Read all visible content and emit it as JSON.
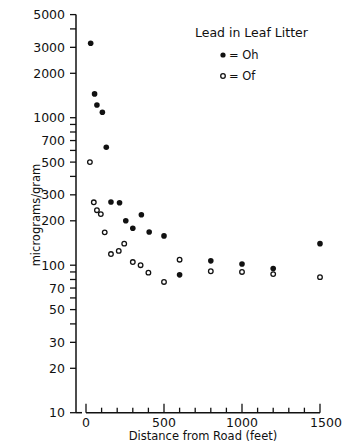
{
  "chart_data": {
    "type": "scatter",
    "title": "",
    "xlabel": "Distance from Road (feet)",
    "ylabel": "micrograms/gram",
    "xlim": [
      0,
      1500
    ],
    "ylim": [
      10,
      5000
    ],
    "yscale": "log",
    "grid": false,
    "legend_position": "upper right",
    "legend_title": "Lead in Leaf Litter",
    "x_ticks": [
      0,
      100,
      200,
      300,
      400,
      500,
      600,
      700,
      800,
      900,
      1000,
      1100,
      1200,
      1300,
      1400,
      1500
    ],
    "x_tick_labels": [
      {
        "value": 0,
        "label": "0"
      },
      {
        "value": 500,
        "label": "500"
      },
      {
        "value": 1000,
        "label": "1000"
      },
      {
        "value": 1500,
        "label": "1500"
      }
    ],
    "y_ticks": [
      10,
      20,
      30,
      40,
      50,
      60,
      70,
      80,
      90,
      100,
      200,
      300,
      400,
      500,
      600,
      700,
      800,
      900,
      1000,
      2000,
      3000,
      4000,
      5000
    ],
    "y_tick_labels": [
      "10",
      "20",
      "30",
      "50",
      "70",
      "100",
      "200",
      "300",
      "500",
      "700",
      "1000",
      "2000",
      "3000",
      "5000"
    ],
    "series": [
      {
        "name": "Oh",
        "legend_label": "= Oh",
        "marker": "filled-circle",
        "points": [
          {
            "x": 30,
            "y": 3200
          },
          {
            "x": 55,
            "y": 1450
          },
          {
            "x": 70,
            "y": 1220
          },
          {
            "x": 105,
            "y": 1090
          },
          {
            "x": 130,
            "y": 630
          },
          {
            "x": 160,
            "y": 268
          },
          {
            "x": 215,
            "y": 265
          },
          {
            "x": 255,
            "y": 200
          },
          {
            "x": 300,
            "y": 178
          },
          {
            "x": 355,
            "y": 220
          },
          {
            "x": 405,
            "y": 168
          },
          {
            "x": 500,
            "y": 158
          },
          {
            "x": 600,
            "y": 86
          },
          {
            "x": 800,
            "y": 107
          },
          {
            "x": 1000,
            "y": 102
          },
          {
            "x": 1200,
            "y": 95
          },
          {
            "x": 1500,
            "y": 140
          }
        ]
      },
      {
        "name": "Of",
        "legend_label": "= Of",
        "marker": "open-circle",
        "points": [
          {
            "x": 25,
            "y": 500
          },
          {
            "x": 50,
            "y": 267
          },
          {
            "x": 70,
            "y": 236
          },
          {
            "x": 95,
            "y": 222
          },
          {
            "x": 120,
            "y": 167
          },
          {
            "x": 160,
            "y": 119
          },
          {
            "x": 210,
            "y": 125
          },
          {
            "x": 245,
            "y": 140
          },
          {
            "x": 300,
            "y": 105
          },
          {
            "x": 350,
            "y": 100
          },
          {
            "x": 400,
            "y": 89
          },
          {
            "x": 500,
            "y": 77
          },
          {
            "x": 600,
            "y": 109
          },
          {
            "x": 800,
            "y": 91
          },
          {
            "x": 1000,
            "y": 90
          },
          {
            "x": 1200,
            "y": 87
          },
          {
            "x": 1500,
            "y": 83
          }
        ]
      }
    ]
  },
  "legend": {
    "title": "Lead in Leaf Litter",
    "items": [
      {
        "label": "= Oh",
        "marker": "filled-circle"
      },
      {
        "label": "= Of",
        "marker": "open-circle"
      }
    ]
  },
  "axes": {
    "x_title": "Distance from Road (feet)",
    "y_title": "micrograms/gram"
  },
  "colors": {
    "ink": "#111111",
    "background": "#ffffff"
  }
}
